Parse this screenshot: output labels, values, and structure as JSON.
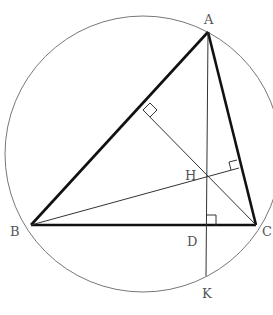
{
  "diagram": {
    "type": "triangle-orthocenter-circumcircle",
    "colors": {
      "thick_line": "#111111",
      "thin_line": "#333333",
      "circle": "#777777",
      "label": "#555555"
    },
    "circle": {
      "cx": 143,
      "cy": 154,
      "r": 138
    },
    "points": {
      "A": {
        "label": "A",
        "x": 208,
        "y": 32
      },
      "B": {
        "label": "B",
        "x": 31,
        "y": 225
      },
      "C": {
        "label": "C",
        "x": 256,
        "y": 225
      },
      "H": {
        "label": "H",
        "x": 206,
        "y": 176
      },
      "D": {
        "label": "D",
        "x": 206,
        "y": 225
      },
      "K": {
        "label": "K",
        "x": 206,
        "y": 276
      },
      "F": {
        "x": 143,
        "y": 110
      },
      "E": {
        "x": 239,
        "y": 168
      }
    },
    "labels": {
      "A": "A",
      "B": "B",
      "C": "C",
      "H": "H",
      "D": "D",
      "K": "K"
    }
  }
}
